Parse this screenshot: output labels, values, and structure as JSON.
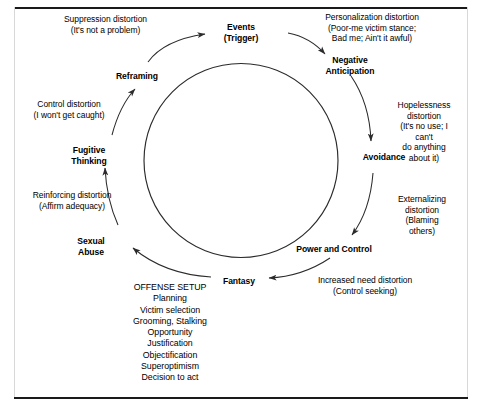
{
  "diagram": {
    "stages": [
      {
        "id": "events",
        "label": "Events\n(Trigger)"
      },
      {
        "id": "negative-anticipation",
        "label": "Negative\nAnticipation"
      },
      {
        "id": "avoidance",
        "label": "Avoidance"
      },
      {
        "id": "power-and-control",
        "label": "Power and Control"
      },
      {
        "id": "fantasy",
        "label": "Fantasy"
      },
      {
        "id": "sexual-abuse",
        "label": "Sexual\nAbuse"
      },
      {
        "id": "fugitive-thinking",
        "label": "Fugitive\nThinking"
      },
      {
        "id": "reframing",
        "label": "Reframing"
      }
    ],
    "distortions": [
      {
        "id": "suppression",
        "label": "Suppression distortion\n(It's not a problem)"
      },
      {
        "id": "personalization",
        "label": "Personalization distortion\n(Poor-me victim stance;\nBad me; Ain't it awful)"
      },
      {
        "id": "hopelessness",
        "label": "Hopelessness distortion\n(It's no use; I can't\ndo anything about it)"
      },
      {
        "id": "externalizing",
        "label": "Externalizing distortion\n(Blaming others)"
      },
      {
        "id": "increased-need",
        "label": "Increased need distortion\n(Control seeking)"
      },
      {
        "id": "reinforcing",
        "label": "Reinforcing distortion\n(Affirm adequacy)"
      },
      {
        "id": "control",
        "label": "Control distortion\n(I won't get caught)"
      }
    ],
    "offense_setup": {
      "heading": "OFFENSE SETUP",
      "items": [
        "Planning",
        "Victim selection",
        "Grooming, Stalking",
        "Opportunity",
        "Justification",
        "Objectification",
        "Superoptimism",
        "Decision to act"
      ],
      "text": "OFFENSE SETUP\nPlanning\nVictim selection\nGrooming, Stalking\nOpportunity\nJustification\nObjectification\nSuperoptimism\nDecision to act"
    },
    "colors": {
      "ink": "#000000",
      "frame": "#1a1a1a",
      "stroke": "#2b2b2b",
      "background": "#ffffff"
    }
  }
}
